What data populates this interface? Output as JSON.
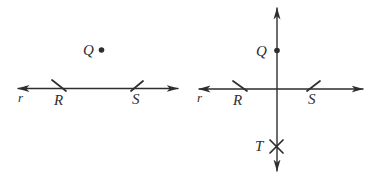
{
  "colors": {
    "ink": "#2e2e2e",
    "background": "#ffffff"
  },
  "figure_left": {
    "line_label": "r",
    "point_R": "R",
    "point_S": "S",
    "point_Q": "Q"
  },
  "figure_right": {
    "line_label": "r",
    "point_R": "R",
    "point_S": "S",
    "point_Q": "Q",
    "point_T": "T"
  }
}
